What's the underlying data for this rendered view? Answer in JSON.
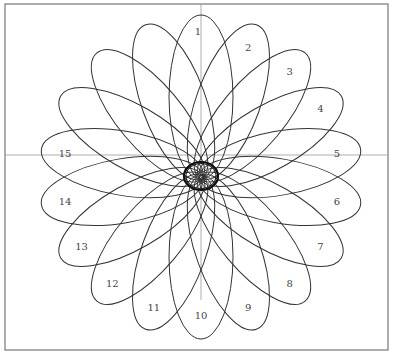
{
  "diagram": {
    "type": "rose-of-ellipses",
    "petal_count": 18,
    "angle_step_deg": 20,
    "center_label": "0",
    "petal_labels": [
      "1",
      "2",
      "3",
      "4",
      "5",
      "6",
      "7",
      "8",
      "9",
      "10",
      "11",
      "12",
      "13",
      "14",
      "15"
    ],
    "colors": {
      "background": "#ffffff",
      "stroke": "#333333",
      "axis": "#888888",
      "frame": "#777777",
      "label": "#444444"
    }
  }
}
